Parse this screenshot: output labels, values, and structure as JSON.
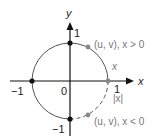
{
  "diagram": {
    "type": "unit-circle",
    "axes": {
      "x_label": "x",
      "y_label": "y"
    },
    "tick_labels": {
      "x_pos": "1",
      "x_neg": "−1",
      "y_pos": "1",
      "y_neg": "−1",
      "origin": "0"
    },
    "annotations": {
      "upper_point": "(u, v), x > 0",
      "lower_point": "(u, v), x < 0",
      "arc_upper": "x",
      "arc_lower": "|x|"
    },
    "colors": {
      "axis": "#111111",
      "circle": "#555555",
      "point_black": "#111111",
      "point_gray": "#888888",
      "label_gray": "#777777"
    }
  }
}
